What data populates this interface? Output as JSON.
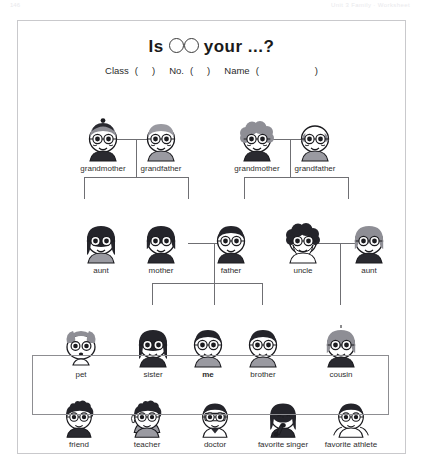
{
  "page_strip": {
    "left": "146",
    "right": "Unit 3   Family   ·   Worksheet"
  },
  "worksheet": {
    "title_prefix": "Is",
    "title_suffix": "your  ...?",
    "circle_count": 2,
    "fields": {
      "class_label": "Class",
      "class_open": "(",
      "class_close": ")",
      "no_label": "No.",
      "no_open": "(",
      "no_close": ")",
      "name_label": "Name",
      "name_open": "(",
      "name_close": ")"
    }
  },
  "tree": {
    "generation1": [
      {
        "id": "grandmother-maternal",
        "label": "grandmother",
        "art": "old-woman-beanie",
        "x": 58,
        "y": 96
      },
      {
        "id": "grandfather-maternal",
        "label": "grandfather",
        "art": "old-man-glasses",
        "x": 116,
        "y": 96
      },
      {
        "id": "grandmother-paternal",
        "label": "grandmother",
        "art": "old-woman-curly",
        "x": 212,
        "y": 96
      },
      {
        "id": "grandfather-paternal",
        "label": "grandfather",
        "art": "old-man-bald",
        "x": 270,
        "y": 96
      }
    ],
    "generation2": [
      {
        "id": "aunt-maternal",
        "label": "aunt",
        "art": "woman-long-hair",
        "x": 56,
        "y": 198
      },
      {
        "id": "mother",
        "label": "mother",
        "art": "woman-bob-dark",
        "x": 116,
        "y": 198
      },
      {
        "id": "father",
        "label": "father",
        "art": "man-short-dark",
        "x": 186,
        "y": 198
      },
      {
        "id": "uncle",
        "label": "uncle",
        "art": "man-curly-beard",
        "x": 258,
        "y": 198
      },
      {
        "id": "aunt-paternal",
        "label": "aunt",
        "art": "woman-bob-grey",
        "x": 324,
        "y": 198
      }
    ],
    "generation3": [
      {
        "id": "pet",
        "label": "pet",
        "art": "dog",
        "x": 36,
        "y": 302
      },
      {
        "id": "sister",
        "label": "sister",
        "art": "girl-long-hair",
        "x": 108,
        "y": 302
      },
      {
        "id": "me",
        "label": "me",
        "art": "child-self",
        "x": 163,
        "y": 302,
        "bold": true
      },
      {
        "id": "brother",
        "label": "brother",
        "art": "boy-short-hair",
        "x": 218,
        "y": 302
      },
      {
        "id": "cousin",
        "label": "cousin",
        "art": "girl-bob-grey",
        "x": 296,
        "y": 302
      }
    ]
  },
  "others_box": {
    "items": [
      {
        "id": "friend",
        "label": "friend",
        "art": "boy-spiky-hair",
        "x": 28,
        "y": 376
      },
      {
        "id": "teacher",
        "label": "teacher",
        "art": "man-pointing",
        "x": 96,
        "y": 376
      },
      {
        "id": "doctor",
        "label": "doctor",
        "art": "doctor-coat",
        "x": 164,
        "y": 376
      },
      {
        "id": "favorite-singer",
        "label": "favorite singer",
        "art": "singer-mic",
        "x": 232,
        "y": 376
      },
      {
        "id": "favorite-athlete",
        "label": "favorite athlete",
        "art": "athlete-muscles",
        "x": 300,
        "y": 376
      }
    ]
  },
  "colors": {
    "ink": "#1a1a1a",
    "line": "#6f6f73",
    "border": "#c9c9cc",
    "box_border": "#8d8d91",
    "hair_dark": "#24242a",
    "hair_grey": "#8e8e95",
    "skin": "#ffffff",
    "shirt_grey": "#9a9aa1",
    "shirt_dark": "#2a2a30"
  }
}
